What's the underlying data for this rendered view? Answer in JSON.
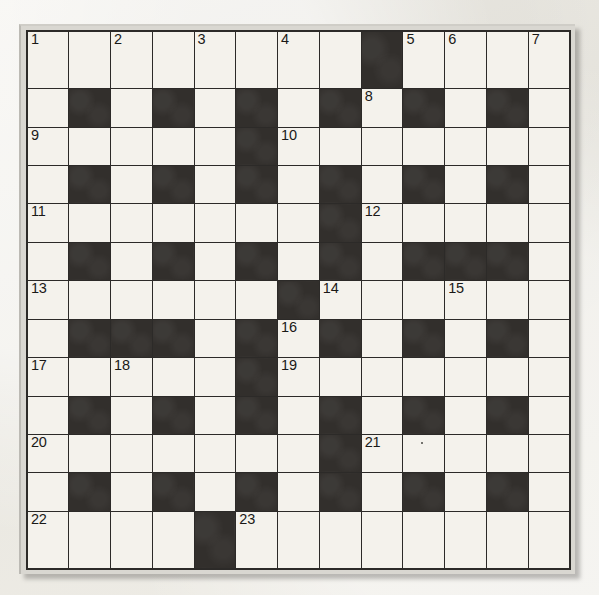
{
  "puzzle": {
    "type": "crossword-grid",
    "title": "Crossword Grid",
    "rows": 13,
    "cols": 13,
    "colors": {
      "page_background": "#eceae4",
      "white_cell": "#f4f2ec",
      "black_cell": "#322f2c",
      "grid_line": "#2c2a28",
      "frame": "#d9d7d1",
      "number_text": "#1a1917"
    },
    "legend": {
      "white": "open letter square",
      "black": "blocked square"
    },
    "max_clue_number": 23,
    "clue_numbers": [
      1,
      2,
      3,
      4,
      5,
      6,
      7,
      8,
      9,
      10,
      11,
      12,
      13,
      14,
      15,
      16,
      17,
      18,
      19,
      20,
      21,
      22,
      23
    ],
    "grid": [
      [
        "w",
        "w",
        "w",
        "w",
        "w",
        "w",
        "w",
        "w",
        "b",
        "w",
        "w",
        "w",
        "w"
      ],
      [
        "w",
        "b",
        "w",
        "b",
        "w",
        "b",
        "w",
        "b",
        "w",
        "b",
        "w",
        "b",
        "w"
      ],
      [
        "w",
        "w",
        "w",
        "w",
        "w",
        "b",
        "w",
        "w",
        "w",
        "w",
        "w",
        "w",
        "w"
      ],
      [
        "w",
        "b",
        "w",
        "b",
        "w",
        "b",
        "w",
        "b",
        "w",
        "b",
        "w",
        "b",
        "w"
      ],
      [
        "w",
        "w",
        "w",
        "w",
        "w",
        "w",
        "w",
        "b",
        "w",
        "w",
        "w",
        "w",
        "w"
      ],
      [
        "w",
        "b",
        "w",
        "b",
        "w",
        "b",
        "w",
        "b",
        "w",
        "b",
        "b",
        "b",
        "w"
      ],
      [
        "w",
        "w",
        "w",
        "w",
        "w",
        "w",
        "b",
        "w",
        "w",
        "w",
        "w",
        "w",
        "w"
      ],
      [
        "w",
        "b",
        "b",
        "b",
        "w",
        "b",
        "w",
        "b",
        "w",
        "b",
        "w",
        "b",
        "w"
      ],
      [
        "w",
        "w",
        "w",
        "w",
        "w",
        "b",
        "w",
        "w",
        "w",
        "w",
        "w",
        "w",
        "w"
      ],
      [
        "w",
        "b",
        "w",
        "b",
        "w",
        "b",
        "w",
        "b",
        "w",
        "b",
        "w",
        "b",
        "w"
      ],
      [
        "w",
        "w",
        "w",
        "w",
        "w",
        "w",
        "w",
        "b",
        "w",
        "w",
        "w",
        "w",
        "w"
      ],
      [
        "w",
        "b",
        "w",
        "b",
        "w",
        "b",
        "w",
        "b",
        "w",
        "b",
        "w",
        "b",
        "w"
      ],
      [
        "w",
        "w",
        "w",
        "w",
        "b",
        "w",
        "w",
        "w",
        "w",
        "w",
        "w",
        "w",
        "w"
      ]
    ],
    "numbers": [
      [
        "1",
        "",
        "2",
        "",
        "3",
        "",
        "4",
        "",
        "",
        "5",
        "6",
        "",
        "7"
      ],
      [
        "",
        "",
        "",
        "",
        "",
        "",
        "",
        "",
        "8",
        "",
        "",
        "",
        ""
      ],
      [
        "9",
        "",
        "",
        "",
        "",
        "",
        "10",
        "",
        "",
        "",
        "",
        "",
        ""
      ],
      [
        "",
        "",
        "",
        "",
        "",
        "",
        "",
        "",
        "",
        "",
        "",
        "",
        ""
      ],
      [
        "11",
        "",
        "",
        "",
        "",
        "",
        "",
        "",
        "12",
        "",
        "",
        "",
        ""
      ],
      [
        "",
        "",
        "",
        "",
        "",
        "",
        "",
        "",
        "",
        "",
        "",
        "",
        ""
      ],
      [
        "13",
        "",
        "",
        "",
        "",
        "",
        "",
        "14",
        "",
        "",
        "15",
        "",
        ""
      ],
      [
        "",
        "",
        "",
        "",
        "",
        "",
        "16",
        "",
        "",
        "",
        "",
        "",
        ""
      ],
      [
        "17",
        "",
        "18",
        "",
        "",
        "",
        "19",
        "",
        "",
        "",
        "",
        "",
        ""
      ],
      [
        "",
        "",
        "",
        "",
        "",
        "",
        "",
        "",
        "",
        "",
        "",
        "",
        ""
      ],
      [
        "20",
        "",
        "",
        "",
        "",
        "",
        "",
        "",
        "21",
        "",
        "",
        "",
        ""
      ],
      [
        "",
        "",
        "",
        "",
        "",
        "",
        "",
        "",
        "",
        "",
        "",
        "",
        ""
      ],
      [
        "22",
        "",
        "",
        "",
        "",
        "23",
        "",
        "",
        "",
        "",
        "",
        "",
        ""
      ]
    ],
    "across_entries": [
      {
        "number": 1,
        "row": 1,
        "col": 1,
        "length": 8
      },
      {
        "number": 5,
        "row": 1,
        "col": 10,
        "length": 4
      },
      {
        "number": 9,
        "row": 3,
        "col": 1,
        "length": 5
      },
      {
        "number": 10,
        "row": 3,
        "col": 7,
        "length": 7
      },
      {
        "number": 11,
        "row": 5,
        "col": 1,
        "length": 7
      },
      {
        "number": 12,
        "row": 5,
        "col": 9,
        "length": 5
      },
      {
        "number": 13,
        "row": 7,
        "col": 1,
        "length": 6
      },
      {
        "number": 14,
        "row": 7,
        "col": 8,
        "length": 6
      },
      {
        "number": 17,
        "row": 9,
        "col": 1,
        "length": 5
      },
      {
        "number": 19,
        "row": 9,
        "col": 7,
        "length": 7
      },
      {
        "number": 20,
        "row": 11,
        "col": 1,
        "length": 7
      },
      {
        "number": 21,
        "row": 11,
        "col": 9,
        "length": 5
      },
      {
        "number": 22,
        "row": 13,
        "col": 1,
        "length": 4
      },
      {
        "number": 23,
        "row": 13,
        "col": 6,
        "length": 8
      }
    ],
    "down_entries": [
      {
        "number": 1,
        "row": 1,
        "col": 1,
        "length": 13
      },
      {
        "number": 2,
        "row": 1,
        "col": 3,
        "length": 7
      },
      {
        "number": 3,
        "row": 1,
        "col": 5,
        "length": 13
      },
      {
        "number": 4,
        "row": 1,
        "col": 7,
        "length": 6
      },
      {
        "number": 5,
        "row": 1,
        "col": 10,
        "length": 5
      },
      {
        "number": 6,
        "row": 1,
        "col": 11,
        "length": 5
      },
      {
        "number": 7,
        "row": 1,
        "col": 13,
        "length": 13
      },
      {
        "number": 8,
        "row": 2,
        "col": 9,
        "length": 5
      },
      {
        "number": 15,
        "row": 7,
        "col": 11,
        "length": 7
      },
      {
        "number": 16,
        "row": 8,
        "col": 7,
        "length": 6
      },
      {
        "number": 18,
        "row": 9,
        "col": 3,
        "length": 5
      }
    ]
  }
}
